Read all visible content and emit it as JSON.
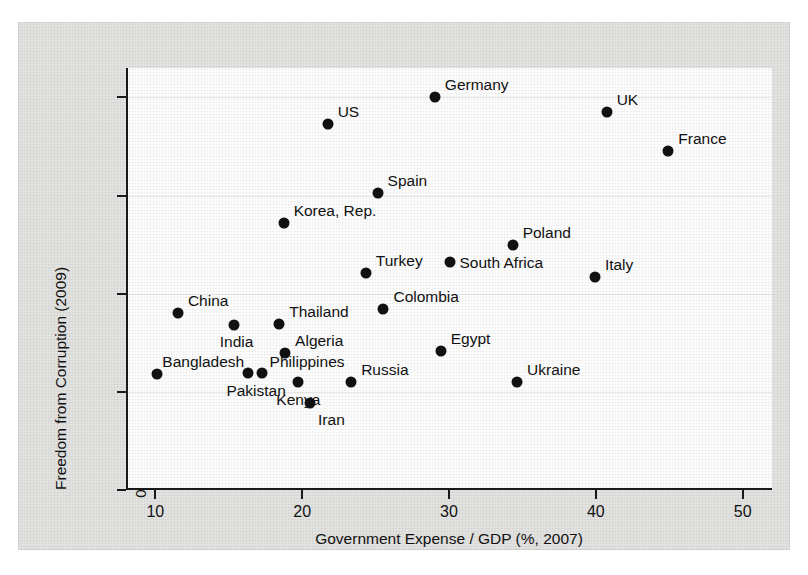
{
  "chart_data": {
    "type": "scatter",
    "title": "",
    "xlabel": "Government Expense / GDP (%, 2007)",
    "ylabel": "Freedom from Corruption (2009)",
    "xlim": [
      8,
      52
    ],
    "ylim": [
      0,
      8.6
    ],
    "xticks": [
      10,
      20,
      30,
      40,
      50
    ],
    "yticks": [
      0,
      2,
      4,
      6,
      8
    ],
    "xtick_labels": [
      "10",
      "20",
      "30",
      "40",
      "50"
    ],
    "ytick_labels": [
      "0",
      "2",
      "4",
      "6",
      "8"
    ],
    "grid": "horizontal",
    "legend": "none",
    "marker": "filled-circle",
    "marker_color": "#111111",
    "points": [
      {
        "label": "Germany",
        "x": 28.9,
        "y": 8.0,
        "lx": 10,
        "ly": -20
      },
      {
        "label": "UK",
        "x": 40.6,
        "y": 7.7,
        "lx": 10,
        "ly": -20
      },
      {
        "label": "US",
        "x": 21.6,
        "y": 7.45,
        "lx": 10,
        "ly": -20
      },
      {
        "label": "France",
        "x": 44.8,
        "y": 6.9,
        "lx": 10,
        "ly": -20
      },
      {
        "label": "Spain",
        "x": 25.0,
        "y": 6.05,
        "lx": 10,
        "ly": -20
      },
      {
        "label": "Korea, Rep.",
        "x": 18.6,
        "y": 5.45,
        "lx": 10,
        "ly": -20
      },
      {
        "label": "Poland",
        "x": 34.2,
        "y": 5.0,
        "lx": 10,
        "ly": -20
      },
      {
        "label": "South Africa",
        "x": 29.9,
        "y": 4.65,
        "lx": 10,
        "ly": -7
      },
      {
        "label": "Turkey",
        "x": 24.2,
        "y": 4.42,
        "lx": 10,
        "ly": -20
      },
      {
        "label": "Italy",
        "x": 39.8,
        "y": 4.35,
        "lx": 10,
        "ly": -20
      },
      {
        "label": "Colombia",
        "x": 25.4,
        "y": 3.68,
        "lx": 10,
        "ly": -20
      },
      {
        "label": "China",
        "x": 11.4,
        "y": 3.6,
        "lx": 10,
        "ly": -20
      },
      {
        "label": "Thailand",
        "x": 18.3,
        "y": 3.38,
        "lx": 10,
        "ly": -20
      },
      {
        "label": "India",
        "x": 15.2,
        "y": 3.37,
        "lx": -14,
        "ly": 9
      },
      {
        "label": "Egypt",
        "x": 29.3,
        "y": 2.83,
        "lx": 10,
        "ly": -20
      },
      {
        "label": "Algeria",
        "x": 18.7,
        "y": 2.79,
        "lx": 10,
        "ly": -20
      },
      {
        "label": "Bangladesh",
        "x": 10.0,
        "y": 2.37,
        "lx": 5,
        "ly": -20
      },
      {
        "label": "Pakistan",
        "x": 16.2,
        "y": 2.38,
        "lx": -22,
        "ly": 10
      },
      {
        "label": "Philippines",
        "x": 17.1,
        "y": 2.38,
        "lx": 8,
        "ly": -19
      },
      {
        "label": "Russia",
        "x": 23.2,
        "y": 2.21,
        "lx": 10,
        "ly": -20
      },
      {
        "label": "Ukraine",
        "x": 34.5,
        "y": 2.21,
        "lx": 10,
        "ly": -20
      },
      {
        "label": "Kenya",
        "x": 19.6,
        "y": 2.21,
        "lx": -22,
        "ly": 10
      },
      {
        "label": "Iran",
        "x": 20.4,
        "y": 1.78,
        "lx": 8,
        "ly": 9
      }
    ]
  }
}
